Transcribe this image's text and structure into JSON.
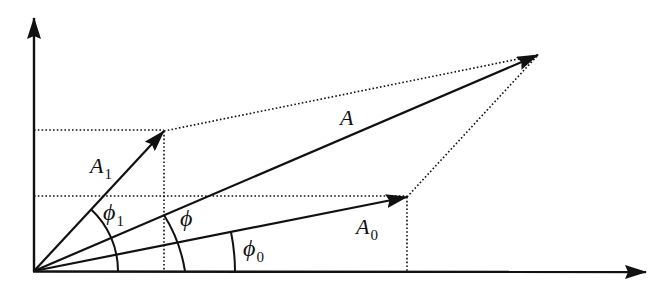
{
  "diagram": {
    "title": "",
    "type": "phasor-vector-addition",
    "colors": {
      "stroke": "#111111",
      "background": "#ffffff"
    },
    "origin": [
      34,
      271
    ],
    "axes": {
      "x_axis": {
        "from": [
          34,
          271
        ],
        "to": [
          646,
          272
        ],
        "arrow": true
      },
      "y_axis": {
        "from": [
          34,
          271
        ],
        "to": [
          34,
          16
        ],
        "arrow": true
      }
    },
    "vectors": [
      {
        "id": "A1",
        "label": "A",
        "subscript": "1",
        "tip": [
          164,
          131
        ]
      },
      {
        "id": "A",
        "label": "A",
        "subscript": "",
        "tip": [
          538,
          55
        ]
      },
      {
        "id": "A0",
        "label": "A",
        "subscript": "0",
        "tip": [
          407,
          197
        ]
      }
    ],
    "angles": [
      {
        "id": "phi1",
        "label": "ϕ",
        "subscript": "1"
      },
      {
        "id": "phi",
        "label": "ϕ",
        "subscript": ""
      },
      {
        "id": "phi0",
        "label": "ϕ",
        "subscript": "0"
      }
    ],
    "dotted_guides": [
      "horizontal from y-axis to A1 tip and on to A tip",
      "horizontal from y-axis to A0 tip",
      "vertical from A1 tip to x-axis",
      "vertical from A0 tip to x-axis",
      "from A0 tip to A tip"
    ]
  },
  "labels": {
    "A1": {
      "main": "A",
      "sub": "1"
    },
    "A": {
      "main": "A",
      "sub": ""
    },
    "A0": {
      "main": "A",
      "sub": "0"
    },
    "phi1": {
      "main": "ϕ",
      "sub": "1"
    },
    "phi": {
      "main": "ϕ",
      "sub": ""
    },
    "phi0": {
      "main": "ϕ",
      "sub": "0"
    }
  }
}
